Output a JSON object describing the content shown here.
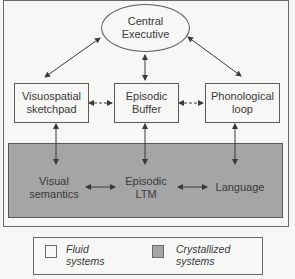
{
  "diagram": {
    "central": {
      "line1": "Central",
      "line2": "Executive"
    },
    "fluid_boxes": [
      {
        "id": "visuospatial",
        "line1": "Visuospatial",
        "line2": "sketchpad"
      },
      {
        "id": "episodic-buffer",
        "line1": "Episodic",
        "line2": "Buffer"
      },
      {
        "id": "phonological",
        "line1": "Phonological",
        "line2": "loop"
      }
    ],
    "crystallized_items": [
      {
        "id": "visual-semantics",
        "line1": "Visual",
        "line2": "semantics"
      },
      {
        "id": "episodic-ltm",
        "line1": "Episodic",
        "line2": "LTM"
      },
      {
        "id": "language",
        "line1": "Language",
        "line2": ""
      }
    ],
    "connections": [
      {
        "from": "Central Executive",
        "to": "Visuospatial sketchpad",
        "style": "solid",
        "direction": "bidirectional"
      },
      {
        "from": "Central Executive",
        "to": "Episodic Buffer",
        "style": "solid",
        "direction": "bidirectional"
      },
      {
        "from": "Central Executive",
        "to": "Phonological loop",
        "style": "solid",
        "direction": "bidirectional"
      },
      {
        "from": "Visuospatial sketchpad",
        "to": "Episodic Buffer",
        "style": "dashed",
        "direction": "bidirectional"
      },
      {
        "from": "Episodic Buffer",
        "to": "Phonological loop",
        "style": "dashed",
        "direction": "bidirectional"
      },
      {
        "from": "Visuospatial sketchpad",
        "to": "Visual semantics",
        "style": "solid",
        "direction": "bidirectional"
      },
      {
        "from": "Episodic Buffer",
        "to": "Episodic LTM",
        "style": "solid",
        "direction": "bidirectional"
      },
      {
        "from": "Phonological loop",
        "to": "Language",
        "style": "solid",
        "direction": "bidirectional"
      },
      {
        "from": "Visual semantics",
        "to": "Episodic LTM",
        "style": "solid",
        "direction": "bidirectional"
      },
      {
        "from": "Episodic LTM",
        "to": "Language",
        "style": "solid",
        "direction": "bidirectional"
      }
    ]
  },
  "legend": {
    "fluid": {
      "line1": "Fluid",
      "line2": "systems",
      "color": "#f7f7f5"
    },
    "crystallized": {
      "line1": "Crystallized",
      "line2": "systems",
      "color": "#a5a5a5"
    }
  },
  "colors": {
    "background": "#f7f7f5",
    "crystallized_fill": "#a5a5a5",
    "stroke": "#4a4a4a",
    "text": "#3a3a3a"
  }
}
